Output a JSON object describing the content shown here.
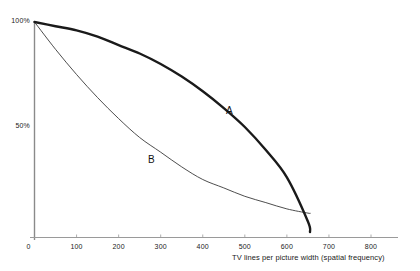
{
  "chart_data": {
    "type": "line",
    "title": "",
    "xlabel": "TV lines per picture width (spatial frequency)",
    "ylabel": "",
    "xlim": [
      0,
      840
    ],
    "ylim": [
      0,
      105
    ],
    "grid": false,
    "legend": "inline-curve-labels",
    "xticks": [
      {
        "value": 0,
        "label": "0"
      },
      {
        "value": 100,
        "label": "100"
      },
      {
        "value": 200,
        "label": "200"
      },
      {
        "value": 300,
        "label": "300"
      },
      {
        "value": 400,
        "label": "400"
      },
      {
        "value": 500,
        "label": "500"
      },
      {
        "value": 600,
        "label": "600"
      },
      {
        "value": 700,
        "label": "700"
      },
      {
        "value": 800,
        "label": "800"
      }
    ],
    "yticks": [
      {
        "value": 100,
        "label": "100%"
      },
      {
        "value": 50,
        "label": "50%"
      }
    ],
    "x": [
      0,
      50,
      100,
      150,
      200,
      250,
      300,
      350,
      400,
      450,
      500,
      550,
      600,
      650,
      655
    ],
    "series": [
      {
        "name": "A",
        "label": "A",
        "color": "#1a1a1a",
        "linewidth": 2.4,
        "annotation": {
          "text": "A",
          "x": 455,
          "y": 57
        },
        "values": [
          100,
          98,
          96,
          93,
          89,
          85,
          80,
          74,
          67,
          59,
          50,
          39,
          26,
          5,
          0
        ]
      },
      {
        "name": "B",
        "label": "B",
        "color": "#3a3a3a",
        "linewidth": 0.9,
        "annotation": {
          "text": "B",
          "x": 270,
          "y": 34
        },
        "values": [
          100,
          87,
          75,
          64,
          54,
          45,
          38,
          31,
          25,
          21,
          17,
          14,
          11,
          9,
          9
        ]
      }
    ]
  },
  "axes": {
    "x_axis_name": "x-axis-line",
    "y_axis_name": "y-axis-line"
  }
}
